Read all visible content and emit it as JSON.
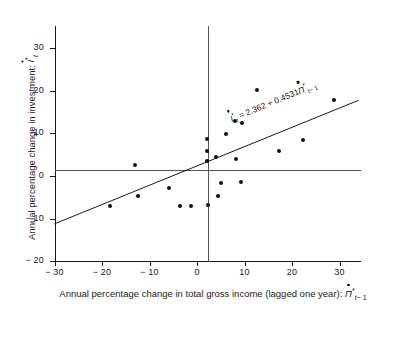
{
  "chart_data": {
    "type": "scatter",
    "title": "",
    "xlabel": "Annual percentage change in total gross income (lagged one year): Π̇*t-1",
    "ylabel": "Annual percentage change in investment: İ*t",
    "xlim": [
      -30,
      34
    ],
    "ylim": [
      -20,
      34
    ],
    "xticks": [
      -30,
      -20,
      -10,
      0,
      10,
      20,
      30
    ],
    "xtick_labels": [
      "− 30",
      "− 20",
      "− 10",
      "0",
      "10",
      "20",
      "30"
    ],
    "yticks": [
      -20,
      -10,
      0,
      10,
      20,
      30
    ],
    "ytick_labels": [
      "− 20",
      "− 10",
      "0",
      "10",
      "20",
      "30"
    ],
    "grid": false,
    "legend": null,
    "annotation": "İ*t = 2.362 + 0.4531Π̇*t-1",
    "regression": {
      "intercept": 2.362,
      "slope": 0.4531,
      "x_start": -30,
      "x_end": 34
    },
    "mean_lines": {
      "x_mean": 2.4,
      "y_mean": 3.4
    },
    "points": [
      {
        "x": -18.3,
        "y": -7.0
      },
      {
        "x": -13.1,
        "y": 2.6
      },
      {
        "x": -12.5,
        "y": -4.6
      },
      {
        "x": -6.0,
        "y": -2.9
      },
      {
        "x": -3.6,
        "y": -7.0
      },
      {
        "x": -1.2,
        "y": -7.0
      },
      {
        "x": 2.2,
        "y": 8.6
      },
      {
        "x": 2.2,
        "y": 5.9
      },
      {
        "x": 2.2,
        "y": 3.5
      },
      {
        "x": 2.3,
        "y": -6.9
      },
      {
        "x": 4.1,
        "y": 4.4
      },
      {
        "x": 4.4,
        "y": -4.6
      },
      {
        "x": 5.1,
        "y": -1.6
      },
      {
        "x": 6.2,
        "y": 9.9
      },
      {
        "x": 8.0,
        "y": 12.9
      },
      {
        "x": 8.3,
        "y": 3.9
      },
      {
        "x": 9.2,
        "y": -1.5
      },
      {
        "x": 9.5,
        "y": 12.4
      },
      {
        "x": 12.6,
        "y": 20.2
      },
      {
        "x": 17.2,
        "y": 5.8
      },
      {
        "x": 22.3,
        "y": 8.4
      },
      {
        "x": 28.8,
        "y": 17.8
      }
    ]
  },
  "labels": {
    "y_axis": {
      "prefix": "Annual percentage change in investment: ",
      "symbol_letter": "I",
      "symbol_star": "*",
      "symbol_sub": "t"
    },
    "x_axis": {
      "prefix": "Annual  percentage change  in total gross income (lagged one year): ",
      "symbol_letter": "Π",
      "symbol_star": "*",
      "symbol_sub": "t",
      "symbol_sub_tail": "− 1"
    },
    "equation": {
      "lhs_letter": "I",
      "lhs_star": "*",
      "lhs_sub": "t",
      "operator_eq": " = ",
      "intercept": "2.362",
      "operator_plus": " + ",
      "slope": "0.4531",
      "rhs_letter": "Π",
      "rhs_star": "*",
      "rhs_sub": "t",
      "rhs_sub_tail": "− 1"
    }
  }
}
